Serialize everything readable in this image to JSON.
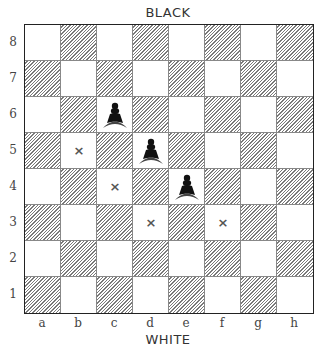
{
  "labels": {
    "top": "BLACK",
    "bottom": "WHITE"
  },
  "board": {
    "files": [
      "a",
      "b",
      "c",
      "d",
      "e",
      "f",
      "g",
      "h"
    ],
    "ranks": [
      "8",
      "7",
      "6",
      "5",
      "4",
      "3",
      "2",
      "1"
    ],
    "pieces": [
      {
        "square": "c6",
        "piece": "black-pawn"
      },
      {
        "square": "d5",
        "piece": "black-pawn"
      },
      {
        "square": "e4",
        "piece": "black-pawn"
      }
    ],
    "markers": [
      {
        "square": "b5",
        "symbol": "×"
      },
      {
        "square": "c4",
        "symbol": "×"
      },
      {
        "square": "d3",
        "symbol": "×"
      },
      {
        "square": "f3",
        "symbol": "×"
      }
    ],
    "colors": {
      "border": "#222222",
      "hatch": "#7a7a7a",
      "piece": "#111111",
      "marker": "#555555"
    }
  }
}
